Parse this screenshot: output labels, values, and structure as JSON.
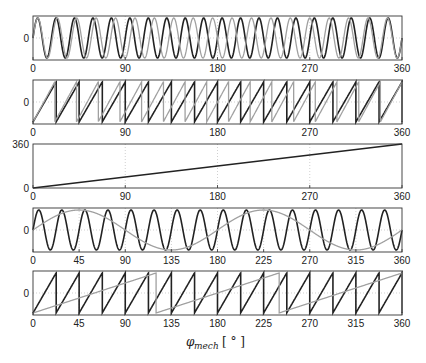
{
  "figure": {
    "xlabel_symbol": "φ",
    "xlabel_sub": "mech",
    "xlabel_unit": "[ ° ]"
  },
  "chart_data": [
    {
      "type": "line",
      "panel": 1,
      "title": "",
      "xlabel": "",
      "ylabel": "",
      "xlim": [
        0,
        360
      ],
      "ylim": [
        -1.1,
        1.1
      ],
      "xticks": [
        0,
        90,
        180,
        270,
        360
      ],
      "yticks": [
        0
      ],
      "ytick_labels": [
        "0"
      ],
      "grid": "dotted at xticks and y=0",
      "series": [
        {
          "name": "black",
          "color": "#222222",
          "shape": "sine",
          "cycles": 20,
          "phase_deg": 0
        },
        {
          "name": "gray",
          "color": "#a0a0a0",
          "shape": "sine",
          "cycles": 19,
          "phase_deg": 0
        }
      ]
    },
    {
      "type": "line",
      "panel": 2,
      "xlim": [
        0,
        360
      ],
      "ylim": [
        -1.1,
        1.1
      ],
      "xticks": [
        0,
        90,
        180,
        270,
        360
      ],
      "yticks": [
        0
      ],
      "ytick_labels": [
        "0"
      ],
      "grid": "dotted at xticks and y=0",
      "series": [
        {
          "name": "black",
          "color": "#222222",
          "shape": "sawtooth",
          "cycles": 16,
          "phase_deg": 0
        },
        {
          "name": "gray",
          "color": "#a0a0a0",
          "shape": "sawtooth",
          "cycles": 17,
          "phase_deg": 0
        }
      ]
    },
    {
      "type": "line",
      "panel": 3,
      "xlim": [
        0,
        360
      ],
      "ylim": [
        0,
        360
      ],
      "xticks": [
        0,
        90,
        180,
        270,
        360
      ],
      "yticks": [
        0,
        360
      ],
      "ytick_labels": [
        "0",
        "360"
      ],
      "grid": "dotted at xticks",
      "series": [
        {
          "name": "black",
          "color": "#222222",
          "shape": "ramp",
          "x": [
            0,
            360
          ],
          "y": [
            0,
            360
          ]
        }
      ]
    },
    {
      "type": "line",
      "panel": 4,
      "xlim": [
        0,
        360
      ],
      "ylim": [
        -1.1,
        1.1
      ],
      "xticks": [
        0,
        45,
        90,
        135,
        180,
        225,
        270,
        315,
        360
      ],
      "yticks": [
        0
      ],
      "ytick_labels": [
        "0"
      ],
      "grid": "dotted at xticks and y=0",
      "series": [
        {
          "name": "black",
          "color": "#222222",
          "shape": "sine",
          "cycles": 16,
          "phase_deg": 0
        },
        {
          "name": "gray",
          "color": "#a0a0a0",
          "shape": "sine",
          "cycles": 2,
          "phase_deg": 0
        }
      ]
    },
    {
      "type": "line",
      "panel": 5,
      "xlim": [
        0,
        360
      ],
      "ylim": [
        -1.1,
        1.1
      ],
      "xticks": [
        0,
        45,
        90,
        135,
        180,
        225,
        270,
        315,
        360
      ],
      "yticks": [
        0
      ],
      "ytick_labels": [
        "0"
      ],
      "grid": "dotted at xticks and y=0",
      "series": [
        {
          "name": "black",
          "color": "#222222",
          "shape": "sawtooth",
          "cycles": 16,
          "phase_deg": 0
        },
        {
          "name": "gray",
          "color": "#a0a0a0",
          "shape": "sawtooth",
          "cycles": 3,
          "phase_deg": 0
        }
      ]
    }
  ],
  "xlabel": "φmech [°]"
}
